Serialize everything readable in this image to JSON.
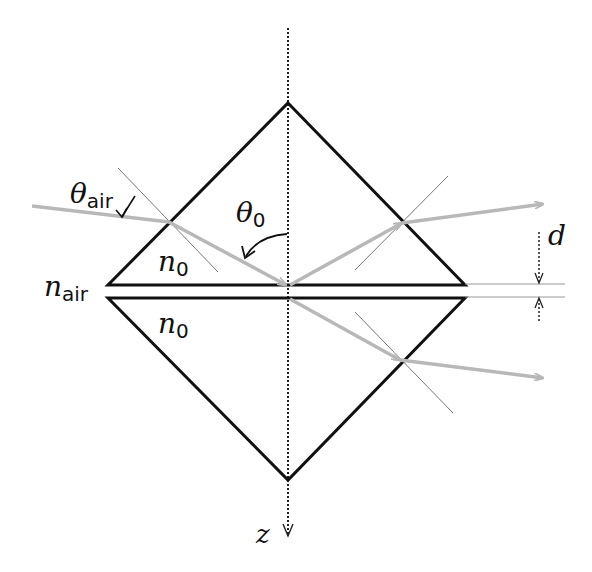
{
  "diagram": {
    "type": "optical-prism-frustrated-total-internal-reflection",
    "labels": {
      "theta_air": {
        "symbol": "θ",
        "subscript": "air"
      },
      "theta_0": {
        "symbol": "θ",
        "subscript": "0"
      },
      "n0_upper": {
        "symbol": "n",
        "subscript": "0"
      },
      "n0_lower": {
        "symbol": "n",
        "subscript": "0"
      },
      "n_air": {
        "symbol": "n",
        "subscript": "air"
      },
      "gap": {
        "symbol": "d"
      },
      "axis": {
        "symbol": "z"
      }
    },
    "colors": {
      "prism_outline": "#111111",
      "ray": "#b8b8b8",
      "normal_lines": "#777777",
      "axis": "#222222"
    }
  }
}
